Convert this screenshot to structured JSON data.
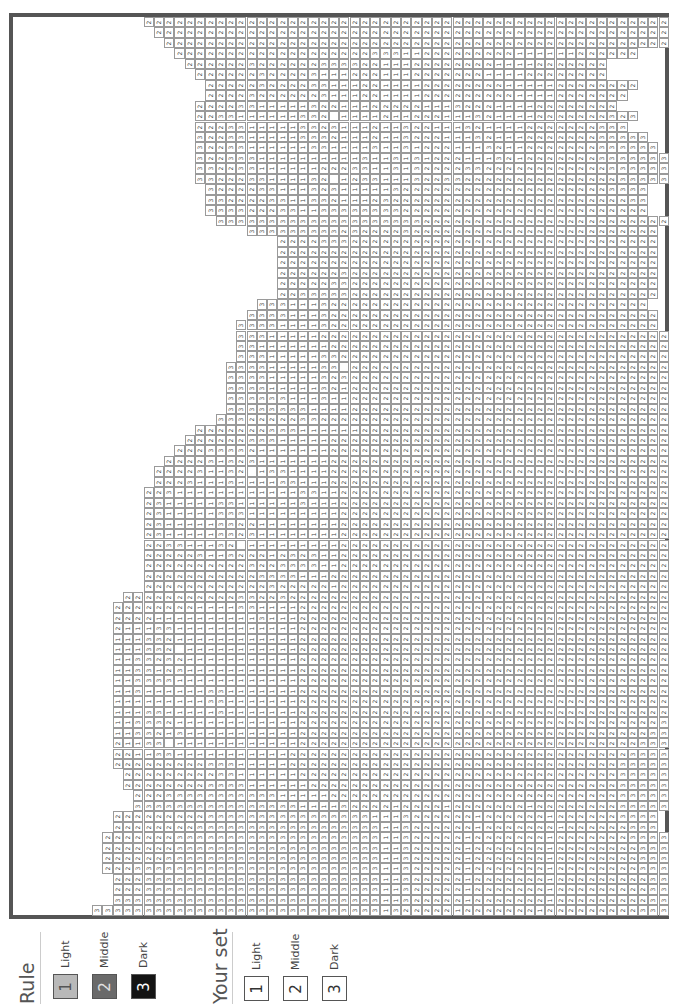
{
  "legend": {
    "rule": {
      "title": "Rule",
      "items": [
        {
          "number": "1",
          "label": "Light",
          "color": "#b9b9b9",
          "text_color": "#555555"
        },
        {
          "number": "2",
          "label": "Middle",
          "color": "#6a6a6a",
          "text_color": "#e0e0e0"
        },
        {
          "number": "3",
          "label": "Dark",
          "color": "#141414",
          "text_color": "#ffffff"
        }
      ]
    },
    "your_set": {
      "title": "Your set",
      "items": [
        {
          "number": "1",
          "label": "Light",
          "color": "#ffffff"
        },
        {
          "number": "2",
          "label": "Middle",
          "color": "#ffffff"
        },
        {
          "number": "3",
          "label": "Dark",
          "color": "#ffffff"
        }
      ]
    }
  },
  "grid": {
    "columns": 56,
    "rows": 86,
    "cell_width": 10.3,
    "cell_height": 10.45,
    "origin_x": 79,
    "origin_y": 0,
    "note_blank": "0 = unnumbered cell",
    "row_data": [
      {
        "start": 5,
        "cells": "222222222222222222222222222222222222222222222222222"
      },
      {
        "start": 6,
        "cells": "22222222222222222222222222222222222222222222222222"
      },
      {
        "start": 7,
        "cells": "2222222222222222222222222222222222222222222222222"
      },
      {
        "start": 8,
        "cells": "222222222222222222233311222222222111111222222"
      },
      {
        "start": 9,
        "cells": "22222232222223333221112222222211112222222"
      },
      {
        "start": 10,
        "cells": "2222223222231112221112222222111122222222"
      },
      {
        "start": 11,
        "cells": "222223222233111221111222222221111122222222"
      },
      {
        "start": 11,
        "cells": "22223222222311122111122222222211112222222"
      },
      {
        "start": 10,
        "cells": "22223311111322111222221113222111122222222"
      },
      {
        "start": 10,
        "cells": "2233111111332011112112221113211112222222323"
      },
      {
        "start": 10,
        "cells": "222331111133231112113221113211112222222333"
      },
      {
        "start": 10,
        "cells": "32233111113332111211322211132111222222233333"
      },
      {
        "start": 10,
        "cells": "322331111113311113113122211132112222222333333"
      },
      {
        "start": 10,
        "cells": "3223331111111111311313122211132122222223333333"
      },
      {
        "start": 10,
        "cells": "33223311111122233113132222332222222222223333333"
      },
      {
        "start": 10,
        "cells": "3322233111132012331113223322222222222222233333"
      },
      {
        "start": 11,
        "cells": "3222233111323111113222222222222222222223333"
      },
      {
        "start": 11,
        "cells": "3322223311332111232222222222222222222222233"
      },
      {
        "start": 11,
        "cells": "3333222331133333333222222222222222222222222"
      },
      {
        "start": 12,
        "cells": "33333333333333333333222222222222222222222222"
      },
      {
        "start": 15,
        "cells": "3333333332322223222222222222222222222222"
      },
      {
        "start": 18,
        "cells": "2222333222222222222222222222222222222"
      },
      {
        "start": 18,
        "cells": "2222222222222222222222222222222222222"
      },
      {
        "start": 18,
        "cells": "2222222222222222222222222222222222222"
      },
      {
        "start": 18,
        "cells": "2222223222222222222222222222222222222"
      },
      {
        "start": 18,
        "cells": "2222233222222222222222222222222222222"
      },
      {
        "start": 18,
        "cells": "2233333222222222222222222222222222222"
      },
      {
        "start": 16,
        "cells": "33311132222222222222222222222222222222"
      },
      {
        "start": 15,
        "cells": "3333111322222222222222222222222222222222"
      },
      {
        "start": 14,
        "cells": "33331111322222222222222222222222222222222"
      },
      {
        "start": 14,
        "cells": "333111112222222222222222222222222222222222"
      },
      {
        "start": 14,
        "cells": "331111111222222222222222222222222222222222"
      },
      {
        "start": 14,
        "cells": "333111113322222222222222222222222222222222"
      },
      {
        "start": 13,
        "cells": "3333111113302222222222222222222222222222222"
      },
      {
        "start": 13,
        "cells": "3333111113232222222222222222222222222222222"
      },
      {
        "start": 13,
        "cells": "3333111113212222222222222222222222222222222"
      },
      {
        "start": 13,
        "cells": "3333331113112222222222222222222222222222222"
      },
      {
        "start": 13,
        "cells": "3333333311112222222222222222222222222222222"
      },
      {
        "start": 12,
        "cells": "33322222332222222222222222222222222222222222"
      },
      {
        "start": 10,
        "cells": "2222222333111111222222222222222222222222222222"
      },
      {
        "start": 9,
        "cells": "22222233311111222222222222222222222222222222222"
      },
      {
        "start": 8,
        "cells": "222333321111111222222222222222222222222222222222"
      },
      {
        "start": 7,
        "cells": "2222313231111111222222222222222222222222222222222"
      },
      {
        "start": 6,
        "cells": "22223113201331111222222222222222222222222222222222"
      },
      {
        "start": 6,
        "cells": "22231113111133111222222222222222222222222222222222"
      },
      {
        "start": 5,
        "cells": "2231111111111113311222222222222222222222222222222222"
      },
      {
        "start": 5,
        "cells": "2311111331111113111222222222222222222222222222222222"
      },
      {
        "start": 5,
        "cells": "2311111333111111111222222222222222222222222222222222"
      },
      {
        "start": 5,
        "cells": "2311111332211111111222222222222222222222222222222222"
      },
      {
        "start": 5,
        "cells": "2311111332311111111222222222222222222222222222222222"
      },
      {
        "start": 5,
        "cells": "2233111320111111111222222222222222222222222222222222"
      },
      {
        "start": 5,
        "cells": "2222231132221232311222222222222222222222222222222222"
      },
      {
        "start": 5,
        "cells": "2222222222322333311222222222222222222222222222222222"
      },
      {
        "start": 5,
        "cells": "2222222222233331112222222222222222222222222222222222"
      },
      {
        "start": 5,
        "cells": "2222222222223222221222222222222222222222222222222222"
      },
      {
        "start": 3,
        "cells": "222222222223322322222222222222222222222222222222222222"
      },
      {
        "start": 2,
        "cells": "2222222211113311112222222222222222222222222222222222222"
      },
      {
        "start": 2,
        "cells": "2222111111111131112222222222222222222222222222222222222"
      },
      {
        "start": 2,
        "cells": "2111331111111111112222222222222222222222222222222222222"
      },
      {
        "start": 2,
        "cells": "1113321111111111112222222222222222222222222222222222222"
      },
      {
        "start": 2,
        "cells": "1113320111111111112222222222222222222222222222222222222"
      },
      {
        "start": 2,
        "cells": "1133232111111111112222222222222222222222222222222222222"
      },
      {
        "start": 2,
        "cells": "1133123111111111112222222222222222222222222222222222222"
      },
      {
        "start": 2,
        "cells": "1133331111111111112222222222222222222222222222222222222"
      },
      {
        "start": 2,
        "cells": "1131111113311111112222222222222222222222222222222222222"
      },
      {
        "start": 2,
        "cells": "1111111113311111112222222222222222222222222222222222222"
      },
      {
        "start": 2,
        "cells": "1113311111311111112222222222222222222222222222222222223"
      },
      {
        "start": 2,
        "cells": "1133321111111111112222222222222222222222222222222222233"
      },
      {
        "start": 2,
        "cells": "1133213111111111112222222222222222222222222222222222333"
      },
      {
        "start": 2,
        "cells": "2113301111111111112222222222222222222222222222222223333"
      },
      {
        "start": 2,
        "cells": "2211331111111111122222222222222222222222222222222233333"
      },
      {
        "start": 2,
        "cells": "2222222223331111122222222222222222222222222222222333333"
      },
      {
        "start": 3,
        "cells": "222222222331111112222222222222222222222222222222333333"
      },
      {
        "start": 3,
        "cells": "22222222333311111122222222222222222222222222222233333"
      },
      {
        "start": 4,
        "cells": "2223333333333311111222222222222222222222222222233333"
      },
      {
        "start": 4,
        "cells": "3333333333333333111132222122221222222212222222233333"
      },
      {
        "start": 2,
        "cells": "22222222233333333333333331113222222122222212222223333"
      },
      {
        "start": 2,
        "cells": "22222222333333333333333333113222222122222221222222333"
      },
      {
        "start": 1,
        "cells": "2222222333333333333333333331132222212222222122222223333"
      },
      {
        "start": 1,
        "cells": "2222222333333333333333333331132222212222222122222222333"
      },
      {
        "start": 1,
        "cells": "2222223333333333333333333331132222212222222122222222333"
      },
      {
        "start": 1,
        "cells": "2223333333333333333333333331132222212222222122222222333"
      },
      {
        "start": 2,
        "cells": "2223333333333333333333333311322222122222221222222222333"
      },
      {
        "start": 2,
        "cells": "2223333333333333333333333311322222122222221222222222333"
      },
      {
        "start": 2,
        "cells": "3333333333333333333333333311322222122222221222222222333"
      },
      {
        "start": 0,
        "cells": "33333333333333333333333333331322222122222221222222222333"
      }
    ]
  }
}
